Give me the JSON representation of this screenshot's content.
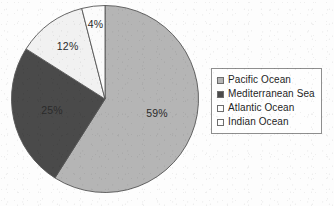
{
  "chart_data": {
    "type": "pie",
    "title": "",
    "subtitle": "",
    "xlabel": "",
    "ylabel": "",
    "grid": false,
    "legend_position": "right",
    "start_angle_deg": 0,
    "direction": "clockwise",
    "categories": [
      "Pacific Ocean",
      "Mediterranean Sea",
      "Atlantic Ocean",
      "Indian Ocean"
    ],
    "values": [
      59,
      25,
      12,
      4
    ],
    "value_unit": "%",
    "slices": [
      {
        "label": "Pacific Ocean",
        "value": 59,
        "data_label": "59%",
        "color": "#b5b5b5",
        "start_deg": 0,
        "end_deg": 212.4
      },
      {
        "label": "Mediterranean Sea",
        "value": 25,
        "data_label": "25%",
        "color": "#4a4a4a",
        "start_deg": 212.4,
        "end_deg": 302.4
      },
      {
        "label": "Atlantic Ocean",
        "value": 12,
        "data_label": "12%",
        "color": "#f1f1f1",
        "start_deg": 302.4,
        "end_deg": 345.6
      },
      {
        "label": "Indian Ocean",
        "value": 4,
        "data_label": "4%",
        "color": "#fbfbfb",
        "start_deg": 345.6,
        "end_deg": 360
      }
    ],
    "data_labels": [
      "59%",
      "25%",
      "12%",
      "4%"
    ]
  },
  "legend": {
    "items": [
      {
        "label": "Pacific Ocean",
        "color": "#b5b5b5"
      },
      {
        "label": "Mediterranean Sea",
        "color": "#4a4a4a"
      },
      {
        "label": "Atlantic Ocean",
        "color": "#fdfdfd"
      },
      {
        "label": "Indian Ocean",
        "color": "#fdfdfd"
      }
    ]
  },
  "colors": {
    "background": "#fdfdfd",
    "pie_outline": "#555555",
    "legend_border": "#8e8e8e",
    "text": "#1f1f1f"
  }
}
